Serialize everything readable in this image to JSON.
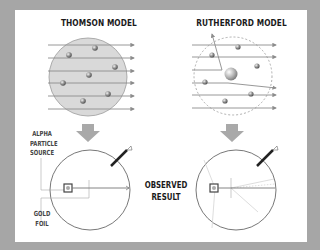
{
  "diagram": {
    "thomson": {
      "title": "THOMSON MODEL"
    },
    "rutherford": {
      "title": "RUTHERFORD MODEL"
    },
    "labels": {
      "source_line1": "ALPHA",
      "source_line2": "PARTICLE",
      "source_line3": "SOURCE",
      "foil_line1": "GOLD",
      "foil_line2": "FOIL",
      "result_line1": "OBSERVED",
      "result_line2": "RESULT"
    },
    "colors": {
      "frame": "#a6a6a6",
      "panel": "#ffffff",
      "plum_pudding_fill": "#d9d9d9",
      "arrow": "#8c8c8c",
      "down_arrow": "#a9a9a9"
    }
  }
}
